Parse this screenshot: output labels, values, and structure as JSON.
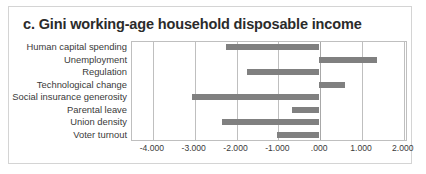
{
  "chart_data": {
    "type": "bar",
    "orientation": "horizontal",
    "title": "c. Gini working-age household disposable income",
    "xlabel": "",
    "ylabel": "",
    "grid": true,
    "legend": false,
    "xlim": [
      -4.5,
      2.1
    ],
    "xticks": [
      -4,
      -3,
      -2,
      -1,
      0,
      1,
      2
    ],
    "xtick_labels": [
      "-4.000",
      "-3.000",
      "-2.000",
      "-1.000",
      ".000",
      "1.000",
      "2.000"
    ],
    "bar_color": "#808080",
    "categories": [
      "Human capital spending",
      "Unemployment",
      "Regulation",
      "Technological change",
      "Social insurance generosity",
      "Parental leave",
      "Union density",
      "Voter turnout"
    ],
    "values": [
      -2.23,
      1.38,
      -1.73,
      0.61,
      -3.05,
      -0.66,
      -2.32,
      -1.0
    ]
  },
  "colors": {
    "bar": "#808080",
    "frame": "#d4d4d4",
    "plot_border": "#bfbfbf",
    "gridline": "#bfbfbf",
    "zero_line": "#a8a8a8",
    "title_text": "#2b2b2b",
    "axis_text": "#3a3a3a",
    "background": "#ffffff"
  }
}
